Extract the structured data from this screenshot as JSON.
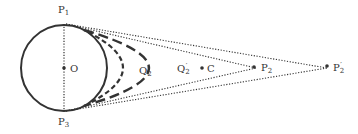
{
  "diagram": {
    "type": "geometric",
    "colors": {
      "stroke": "#333333",
      "background": "#ffffff"
    },
    "circle": {
      "center_label": "O"
    },
    "points": {
      "P1": {
        "base": "P",
        "sub": "1",
        "prime": ""
      },
      "P3": {
        "base": "P",
        "sub": "3",
        "prime": ""
      },
      "O": {
        "base": "O",
        "sub": "",
        "prime": ""
      },
      "Q2": {
        "base": "Q",
        "sub": "2",
        "prime": ""
      },
      "Q2p": {
        "base": "Q",
        "sub": "2",
        "prime": "′"
      },
      "C": {
        "base": "C",
        "sub": "",
        "prime": ""
      },
      "P2": {
        "base": "P",
        "sub": "2",
        "prime": ""
      },
      "P2p": {
        "base": "P",
        "sub": "2",
        "prime": "′"
      }
    },
    "curves": [
      {
        "name": "inner-dashed-curve",
        "apex": "Q2",
        "style": "short-dash"
      },
      {
        "name": "outer-dashed-curve",
        "apex": "Q2p",
        "style": "long-dash"
      }
    ],
    "dotted_lines": [
      "P1-P3",
      "P1-P2",
      "P3-P2",
      "P1-P2p",
      "P3-P2p"
    ]
  }
}
